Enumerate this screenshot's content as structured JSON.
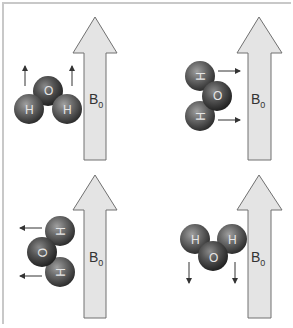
{
  "diagram": {
    "field_label": "B",
    "field_subscript": "0",
    "colors": {
      "frame_border": "#c8c8c8",
      "field_arrow_fill": "#e4e4e4",
      "field_arrow_stroke": "#707070",
      "atom_fill": "#5a5a5a",
      "atom_highlight": "#9a9a9a",
      "atom_label": "#e6e6e6",
      "motion_arrow": "#333333"
    },
    "panels": [
      {
        "id": "top-left",
        "field_label": "B0",
        "atoms": [
          {
            "element": "O",
            "label": "O"
          },
          {
            "element": "H",
            "label": "H"
          },
          {
            "element": "H",
            "label": "H"
          }
        ],
        "motion_direction": "up"
      },
      {
        "id": "top-right",
        "field_label": "B0",
        "atoms": [
          {
            "element": "H",
            "label": "H"
          },
          {
            "element": "O",
            "label": "O"
          },
          {
            "element": "H",
            "label": "H"
          }
        ],
        "motion_direction": "right"
      },
      {
        "id": "bottom-left",
        "field_label": "B0",
        "atoms": [
          {
            "element": "H",
            "label": "H"
          },
          {
            "element": "O",
            "label": "O"
          },
          {
            "element": "H",
            "label": "H"
          }
        ],
        "motion_direction": "left"
      },
      {
        "id": "bottom-right",
        "field_label": "B0",
        "atoms": [
          {
            "element": "H",
            "label": "H"
          },
          {
            "element": "O",
            "label": "O"
          },
          {
            "element": "H",
            "label": "H"
          }
        ],
        "motion_direction": "down"
      }
    ]
  }
}
